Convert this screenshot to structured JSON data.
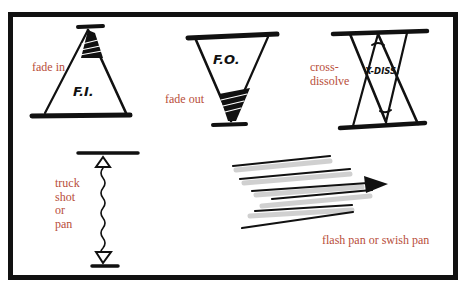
{
  "colors": {
    "label": "#b84e3a",
    "ink": "#111111",
    "frame": "#111111",
    "background": "#ffffff"
  },
  "diagrams": [
    {
      "id": "fade-in",
      "label": "fade in",
      "inscription": "F.I."
    },
    {
      "id": "fade-out",
      "label": "fade out",
      "inscription": "F.O."
    },
    {
      "id": "cross-dissolve",
      "label_lines": [
        "cross-",
        "dissolve"
      ],
      "inscription": "X-DISS."
    },
    {
      "id": "truck-shot",
      "label_lines": [
        "truck",
        "shot",
        "or",
        "pan"
      ]
    },
    {
      "id": "flash-pan",
      "label": "flash pan or swish pan"
    }
  ]
}
